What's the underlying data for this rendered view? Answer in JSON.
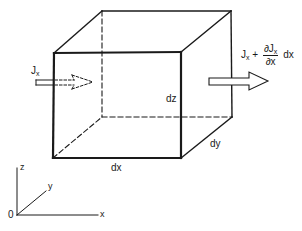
{
  "diagram": {
    "type": "control-volume-flux",
    "colors": {
      "stroke": "#1a1a1a",
      "background": "#ffffff"
    },
    "labels": {
      "inflow_main": "J",
      "inflow_sub": "x",
      "outflow_main": "J",
      "outflow_sub": "x",
      "outflow_plus": "+",
      "outflow_num_partial": "∂J",
      "outflow_num_sub": "x",
      "outflow_den": "∂x",
      "outflow_tail": "dx",
      "edge_dx": "dx",
      "edge_dy": "dy",
      "edge_dz": "dz",
      "axis_origin": "0",
      "axis_x": "x",
      "axis_y": "y",
      "axis_z": "z"
    }
  }
}
